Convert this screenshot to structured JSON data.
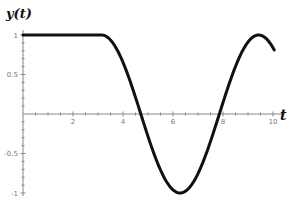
{
  "chart_data": {
    "type": "line",
    "title": "",
    "xlabel": "t",
    "ylabel": "y(t)",
    "xlim": [
      0,
      10.3
    ],
    "ylim": [
      -1,
      1
    ],
    "grid": false,
    "legend": null,
    "x_ticks": [
      2,
      4,
      6,
      8,
      10
    ],
    "x_tick_labels": [
      "2",
      "4",
      "6",
      "8",
      "10"
    ],
    "y_ticks": [
      1,
      0.5,
      -0.5,
      -1
    ],
    "y_tick_labels": [
      "1",
      "0.5",
      "-0.5",
      "-1"
    ],
    "series": [
      {
        "name": "y(t)",
        "x": [
          0,
          1,
          2,
          3,
          3.14,
          3.5,
          4,
          4.5,
          4.71,
          5,
          5.5,
          6,
          6.28,
          6.5,
          7,
          7.5,
          7.85,
          8,
          8.5,
          9,
          9.42,
          9.8,
          10.1
        ],
        "y": [
          1,
          1,
          1,
          1,
          1,
          0.94,
          0.65,
          0.21,
          0,
          -0.28,
          -0.71,
          -0.96,
          -1,
          -0.98,
          -0.75,
          -0.35,
          0,
          0.15,
          0.6,
          0.91,
          1,
          0.93,
          0.81
        ]
      }
    ]
  }
}
